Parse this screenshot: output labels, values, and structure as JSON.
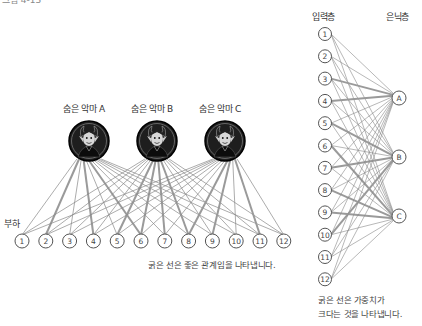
{
  "top_partial_text": "그림 4-13",
  "left_diagram": {
    "hidden_labels": [
      "숨은 악마 A",
      "숨은 악마 B",
      "숨은 악마 C"
    ],
    "input_group_label": "부하",
    "input_nodes": [
      "1",
      "2",
      "3",
      "4",
      "5",
      "6",
      "7",
      "8",
      "9",
      "10",
      "11",
      "12"
    ],
    "caption": "굵은 선은 좋은 관계임을 나타냅니다.",
    "thick_links": [
      [
        0,
        3
      ],
      [
        0,
        1
      ],
      [
        1,
        4
      ],
      [
        1,
        6
      ],
      [
        1,
        7
      ],
      [
        2,
        7
      ],
      [
        2,
        10
      ],
      [
        2,
        8
      ],
      [
        0,
        5
      ],
      [
        1,
        5
      ]
    ],
    "icon": "devil-icon"
  },
  "right_diagram": {
    "input_layer_label": "입력층",
    "hidden_layer_label": "은닉층",
    "input_nodes": [
      "1",
      "2",
      "3",
      "4",
      "5",
      "6",
      "7",
      "8",
      "9",
      "10",
      "11",
      "12"
    ],
    "hidden_nodes": [
      "A",
      "B",
      "C"
    ],
    "caption_line1": "굵은 선은 가중치가",
    "caption_line2": "크다는 것을 나타냅니다.",
    "thick_links": [
      [
        3,
        0
      ],
      [
        4,
        1
      ],
      [
        6,
        1
      ],
      [
        5,
        2
      ],
      [
        7,
        2
      ],
      [
        9,
        1
      ],
      [
        2,
        0
      ],
      [
        8,
        2
      ]
    ]
  },
  "colors": {
    "line": "#888888",
    "thick_line": "#9a9a9a",
    "devil_bg": "#1e1e1e",
    "node_stroke": "#555555"
  }
}
